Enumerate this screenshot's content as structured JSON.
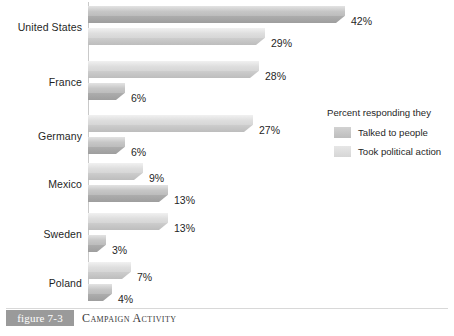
{
  "chart_data": {
    "type": "bar",
    "orientation": "horizontal",
    "title": "Campaign Activity",
    "figure_number": "figure 7-3",
    "categories": [
      "United States",
      "France",
      "Germany",
      "Mexico",
      "Sweden",
      "Poland"
    ],
    "series": [
      {
        "name": "Talked to people",
        "values": [
          42,
          28,
          27,
          9,
          13,
          7
        ],
        "color": "#adadad"
      },
      {
        "name": "Took political action",
        "values": [
          29,
          6,
          6,
          13,
          3,
          4
        ],
        "color": "#cdcdcd"
      }
    ],
    "value_labels": [
      [
        "42%",
        "29%"
      ],
      [
        "28%",
        "6%"
      ],
      [
        "27%",
        "6%"
      ],
      [
        "9%",
        "13%"
      ],
      [
        "13%",
        "3%"
      ],
      [
        "7%",
        "4%"
      ]
    ],
    "legend_title": "Percent responding they",
    "legend_position": "right",
    "xlabel": "",
    "ylabel": "",
    "xlim": [
      0,
      50
    ],
    "grid": false,
    "unit": "%"
  },
  "caption": {
    "tag": "figure 7-3",
    "title": "Campaign Activity"
  },
  "legend": {
    "title": "Percent responding they",
    "items": [
      {
        "label": "Talked to people"
      },
      {
        "label": "Took political action"
      }
    ]
  },
  "categories": [
    {
      "label": "United States",
      "a": "42%",
      "b": "29%"
    },
    {
      "label": "France",
      "a": "28%",
      "b": "6%"
    },
    {
      "label": "Germany",
      "a": "27%",
      "b": "6%"
    },
    {
      "label": "Mexico",
      "a": "9%",
      "b": "13%"
    },
    {
      "label": "Sweden",
      "a": "13%",
      "b": "3%"
    },
    {
      "label": "Poland",
      "a": "7%",
      "b": "4%"
    }
  ]
}
